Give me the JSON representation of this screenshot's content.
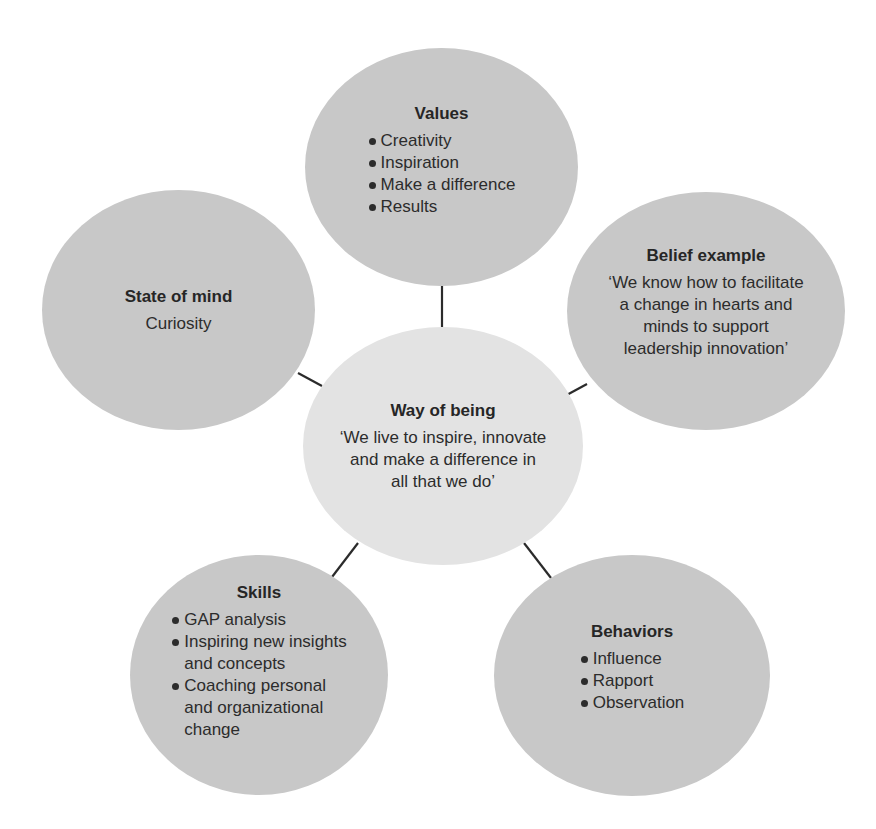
{
  "diagram": {
    "type": "hub-and-spoke",
    "colors": {
      "outer_node_fill": "#c8c8c8",
      "center_node_fill": "#e3e3e3",
      "connector": "#2b2b2b",
      "text": "#2a2a2a"
    },
    "center": {
      "title": "Way of being",
      "text": "‘We live to inspire, innovate and make a difference in all that we do’",
      "lines": [
        "‘We live to inspire, innovate",
        "and make a difference in",
        "all that we do’"
      ]
    },
    "nodes": {
      "values": {
        "title": "Values",
        "items": [
          "Creativity",
          "Inspiration",
          "Make a difference",
          "Results"
        ]
      },
      "belief": {
        "title": "Belief example",
        "text": "‘We know how to facilitate a change in hearts and minds to support leadership innovation’",
        "lines": [
          "‘We know how to facilitate",
          "a change in hearts and",
          "minds to support",
          "leadership innovation’"
        ]
      },
      "state_of_mind": {
        "title": "State of mind",
        "text": "Curiosity"
      },
      "skills": {
        "title": "Skills",
        "items": [
          "GAP analysis",
          "Inspiring new insights and concepts",
          "Coaching personal and organizational change"
        ],
        "item_lines": [
          [
            "GAP analysis"
          ],
          [
            "Inspiring new insights",
            "and concepts"
          ],
          [
            "Coaching personal",
            "and organizational",
            "change"
          ]
        ]
      },
      "behaviors": {
        "title": "Behaviors",
        "items": [
          "Influence",
          "Rapport",
          "Observation"
        ]
      }
    }
  }
}
